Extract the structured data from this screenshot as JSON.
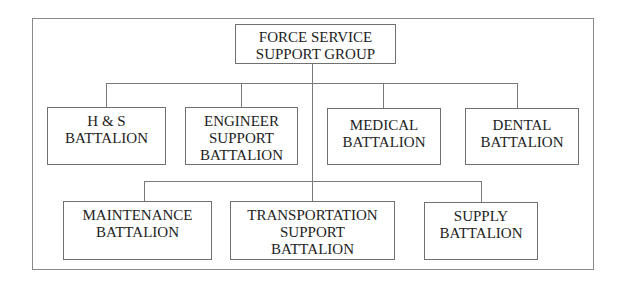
{
  "diagram": {
    "type": "org-chart",
    "root": {
      "label": "FORCE SERVICE\nSUPPORT GROUP"
    },
    "row1": [
      {
        "label": "H & S\nBATTALION"
      },
      {
        "label": "ENGINEER\nSUPPORT\nBATTALION"
      },
      {
        "label": "MEDICAL\nBATTALION"
      },
      {
        "label": "DENTAL\nBATTALION"
      }
    ],
    "row2": [
      {
        "label": "MAINTENANCE\nBATTALION"
      },
      {
        "label": "TRANSPORTATION\nSUPPORT\nBATTALION"
      },
      {
        "label": "SUPPLY\nBATTALION"
      }
    ]
  }
}
